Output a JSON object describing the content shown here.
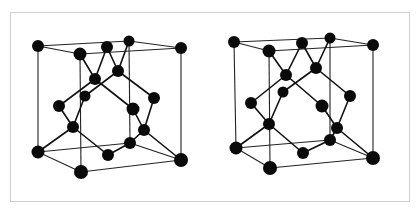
{
  "figure": {
    "colors": {
      "atom": "#0a0a0a",
      "bond": "#111111",
      "frame": "#cfcfcf",
      "background": "#ffffff"
    }
  },
  "cubes": [
    {
      "name": "left-view",
      "atoms": [
        [
          38,
          46,
          6
        ],
        [
          80,
          54,
          6.5
        ],
        [
          107,
          47,
          6
        ],
        [
          129,
          41,
          5.5
        ],
        [
          181,
          48,
          6
        ],
        [
          95,
          79,
          6
        ],
        [
          118,
          71,
          6
        ],
        [
          85,
          96,
          5.5
        ],
        [
          59,
          106,
          6
        ],
        [
          133,
          109,
          6.5
        ],
        [
          154,
          98,
          6
        ],
        [
          73,
          127,
          6
        ],
        [
          144,
          130,
          6
        ],
        [
          130,
          143,
          6
        ],
        [
          108,
          155,
          6
        ],
        [
          38,
          152,
          6.5
        ],
        [
          81,
          172,
          7
        ],
        [
          181,
          160,
          7
        ]
      ],
      "edges": [
        [
          38,
          46,
          129,
          41
        ],
        [
          129,
          41,
          181,
          48
        ],
        [
          38,
          46,
          80,
          54
        ],
        [
          80,
          54,
          181,
          48
        ],
        [
          38,
          46,
          38,
          152
        ],
        [
          80,
          54,
          81,
          172
        ],
        [
          129,
          41,
          130,
          143
        ],
        [
          181,
          48,
          181,
          160
        ],
        [
          38,
          152,
          81,
          172
        ],
        [
          81,
          172,
          181,
          160
        ],
        [
          38,
          152,
          130,
          143
        ],
        [
          130,
          143,
          181,
          160
        ]
      ],
      "bonds": [
        [
          80,
          54,
          95,
          79
        ],
        [
          107,
          47,
          95,
          79
        ],
        [
          107,
          47,
          118,
          71
        ],
        [
          129,
          41,
          118,
          71
        ],
        [
          95,
          79,
          59,
          106
        ],
        [
          118,
          71,
          85,
          96
        ],
        [
          95,
          79,
          133,
          109
        ],
        [
          118,
          71,
          154,
          98
        ],
        [
          59,
          106,
          73,
          127
        ],
        [
          85,
          96,
          73,
          127
        ],
        [
          133,
          109,
          144,
          130
        ],
        [
          154,
          98,
          144,
          130
        ],
        [
          73,
          127,
          38,
          152
        ],
        [
          73,
          127,
          108,
          155
        ],
        [
          144,
          130,
          130,
          143
        ],
        [
          144,
          130,
          181,
          160
        ],
        [
          108,
          155,
          130,
          143
        ]
      ]
    },
    {
      "name": "right-view",
      "atoms": [
        [
          234,
          42,
          6
        ],
        [
          269,
          51,
          6.5
        ],
        [
          302,
          43,
          6
        ],
        [
          330,
          38,
          5.5
        ],
        [
          373,
          45,
          6
        ],
        [
          286,
          75,
          6
        ],
        [
          316,
          68,
          6
        ],
        [
          283,
          92,
          5.5
        ],
        [
          251,
          103,
          6
        ],
        [
          322,
          106,
          6.5
        ],
        [
          350,
          96,
          6
        ],
        [
          269,
          124,
          6
        ],
        [
          337,
          128,
          6
        ],
        [
          330,
          140,
          6
        ],
        [
          303,
          153,
          6
        ],
        [
          236,
          148,
          6.5
        ],
        [
          270,
          168,
          7
        ],
        [
          373,
          158,
          7
        ]
      ],
      "edges": [
        [
          234,
          42,
          330,
          38
        ],
        [
          330,
          38,
          373,
          45
        ],
        [
          234,
          42,
          269,
          51
        ],
        [
          269,
          51,
          373,
          45
        ],
        [
          234,
          42,
          236,
          148
        ],
        [
          269,
          51,
          270,
          168
        ],
        [
          330,
          38,
          330,
          140
        ],
        [
          373,
          45,
          373,
          158
        ],
        [
          236,
          148,
          270,
          168
        ],
        [
          270,
          168,
          373,
          158
        ],
        [
          236,
          148,
          330,
          140
        ],
        [
          330,
          140,
          373,
          158
        ]
      ],
      "bonds": [
        [
          269,
          51,
          286,
          75
        ],
        [
          302,
          43,
          286,
          75
        ],
        [
          302,
          43,
          316,
          68
        ],
        [
          330,
          38,
          316,
          68
        ],
        [
          286,
          75,
          251,
          103
        ],
        [
          316,
          68,
          283,
          92
        ],
        [
          286,
          75,
          322,
          106
        ],
        [
          316,
          68,
          350,
          96
        ],
        [
          251,
          103,
          269,
          124
        ],
        [
          283,
          92,
          269,
          124
        ],
        [
          322,
          106,
          337,
          128
        ],
        [
          350,
          96,
          337,
          128
        ],
        [
          269,
          124,
          236,
          148
        ],
        [
          269,
          124,
          303,
          153
        ],
        [
          337,
          128,
          330,
          140
        ],
        [
          337,
          128,
          373,
          158
        ],
        [
          303,
          153,
          330,
          140
        ]
      ]
    }
  ]
}
